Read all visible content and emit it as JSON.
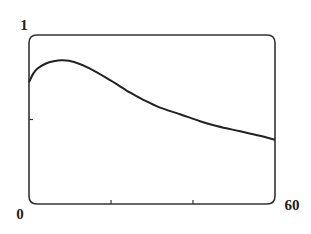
{
  "chart_data": {
    "type": "line",
    "title": "",
    "xlabel": "",
    "ylabel": "",
    "xlim": [
      0,
      60
    ],
    "ylim": [
      0,
      1
    ],
    "x_tick_labels": {
      "min": "0",
      "max": "60"
    },
    "y_tick_labels": {
      "max": "1"
    },
    "x_ticks": [
      20,
      40
    ],
    "y_ticks": [
      0.5
    ],
    "grid": false,
    "series": [
      {
        "name": "curve",
        "x": [
          0,
          1,
          2,
          4,
          6,
          8.3,
          11,
          15,
          20,
          24.6,
          28,
          32,
          37,
          41.7,
          46,
          51.5,
          56,
          60
        ],
        "y": [
          0.72,
          0.77,
          0.8,
          0.83,
          0.845,
          0.85,
          0.84,
          0.8,
          0.73,
          0.66,
          0.615,
          0.57,
          0.53,
          0.49,
          0.46,
          0.43,
          0.405,
          0.38
        ]
      }
    ]
  }
}
